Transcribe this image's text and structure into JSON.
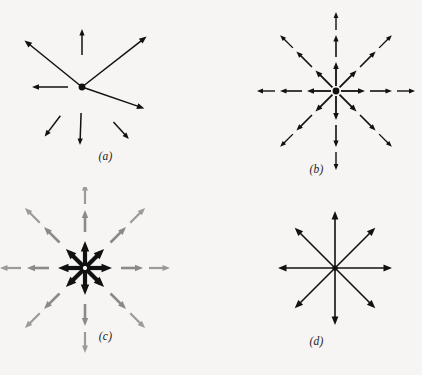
{
  "figure": {
    "background_color": "#f7f5f3",
    "ink_color": "#111111",
    "secondary_color": "#808080",
    "width": 422,
    "height": 375
  },
  "panels": [
    {
      "id": "a",
      "label": "(a)",
      "caption_text": "(a)",
      "center": {
        "x": 82,
        "y": 87
      },
      "has_center_dot": true,
      "dot_radius": 3.4,
      "description": "Irregular set of eight arrows of differing lengths and angles around a central dot; some touch the dot, others are detached.",
      "arrow_count": 8,
      "stroke_color": "#111111",
      "arrows": [
        {
          "name": "upper-left-long",
          "angle_deg": 141,
          "start_r": 0,
          "end_r": 74,
          "width": 1.5,
          "head": 7.5,
          "color": "#111111"
        },
        {
          "name": "up-short",
          "angle_deg": 90,
          "start_r": 32,
          "end_r": 58,
          "width": 1.5,
          "head": 6.5,
          "color": "#111111"
        },
        {
          "name": "upper-right-long",
          "angle_deg": 38,
          "start_r": 0,
          "end_r": 82,
          "width": 1.5,
          "head": 7.5,
          "color": "#111111"
        },
        {
          "name": "left-medium",
          "angle_deg": 180,
          "start_r": 14,
          "end_r": 50,
          "width": 1.5,
          "head": 7.0,
          "color": "#111111"
        },
        {
          "name": "lower-right-long",
          "angle_deg": -19,
          "start_r": 0,
          "end_r": 66,
          "width": 1.5,
          "head": 7.5,
          "color": "#111111"
        },
        {
          "name": "lower-left-short",
          "angle_deg": -127,
          "start_r": 36,
          "end_r": 62,
          "width": 1.5,
          "head": 6.5,
          "color": "#111111"
        },
        {
          "name": "down-short",
          "angle_deg": -92,
          "start_r": 26,
          "end_r": 58,
          "width": 1.5,
          "head": 6.5,
          "color": "#111111"
        },
        {
          "name": "lower-right-short",
          "angle_deg": -48,
          "start_r": 47,
          "end_r": 70,
          "width": 1.5,
          "head": 6.5,
          "color": "#111111"
        }
      ]
    },
    {
      "id": "b",
      "label": "(b)",
      "caption_text": "(b)",
      "center": {
        "x": 125,
        "y": 91
      },
      "has_center_dot": true,
      "dot_radius": 3.4,
      "description": "Eight evenly spaced directions at 45 degree steps; each direction carries three collinear arrows of increasing distance from the centre.",
      "arrow_count": 24,
      "directions_deg": [
        0,
        45,
        90,
        135,
        180,
        225,
        270,
        315
      ],
      "segments_per_direction": 3,
      "stroke_color": "#111111",
      "segment_radii": [
        {
          "start_r": 5,
          "end_r": 29
        },
        {
          "start_r": 34,
          "end_r": 56
        },
        {
          "start_r": 61,
          "end_r": 79
        }
      ],
      "segment_widths": [
        1.8,
        1.6,
        1.4
      ],
      "segment_heads": [
        7.0,
        6.5,
        6.0
      ]
    },
    {
      "id": "c",
      "label": "(c)",
      "caption_text": "(c)",
      "center": {
        "x": 85,
        "y": 81
      },
      "has_center_dot": false,
      "description": "Eight evenly spaced directions; short heavy black arrows cluster at the centre while longer light grey arrows continue outward in two further ranks.",
      "arrow_count": 24,
      "directions_deg": [
        0,
        45,
        90,
        135,
        180,
        225,
        270,
        315
      ],
      "segments_per_direction": 3,
      "inner_color": "#111111",
      "outer_color": "#8a8a8a",
      "segment_radii": [
        {
          "start_r": 2,
          "end_r": 27
        },
        {
          "start_r": 36,
          "end_r": 58
        },
        {
          "start_r": 64,
          "end_r": 85
        }
      ],
      "segment_widths": [
        4.2,
        2.6,
        2.2
      ],
      "segment_heads": [
        10.5,
        8.0,
        7.5
      ],
      "segment_colors": [
        "#111111",
        "#8a8a8a",
        "#9a9a9a"
      ]
    },
    {
      "id": "d",
      "label": "(d)",
      "caption_text": "(d)",
      "center": {
        "x": 124,
        "y": 81
      },
      "has_center_dot": true,
      "dot_radius": 2.6,
      "description": "Eight long single arrows of equal length radiating from a common centre at 45 degree intervals.",
      "arrow_count": 8,
      "directions_deg": [
        0,
        45,
        90,
        135,
        180,
        225,
        270,
        315
      ],
      "segments_per_direction": 1,
      "stroke_color": "#111111",
      "segment_radii": [
        {
          "start_r": 0,
          "end_r": 57
        }
      ],
      "segment_widths": [
        1.6
      ],
      "segment_heads": [
        8.5
      ]
    }
  ]
}
